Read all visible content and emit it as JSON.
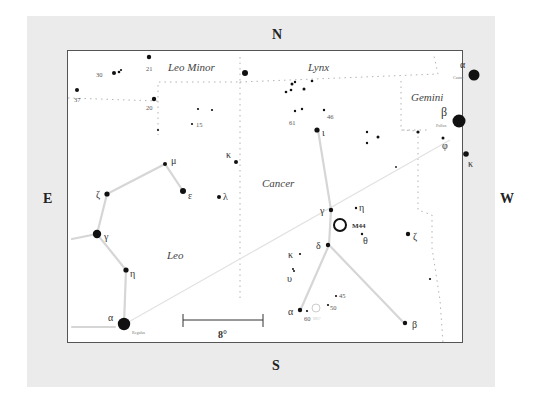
{
  "compass": {
    "north": "N",
    "south": "S",
    "east": "E",
    "west": "W"
  },
  "constellations": {
    "leo_minor": "Leo Minor",
    "lynx": "Lynx",
    "gemini": "Gemini",
    "cancer": "Cancer",
    "leo": "Leo"
  },
  "scale_bar": {
    "label": "8°"
  },
  "star_names": {
    "castor": "Castor",
    "pollux": "Pollux",
    "regulus": "Regulus"
  },
  "deep_sky": {
    "m44": "M44",
    "m67": "M67"
  },
  "labels": {
    "n30": "30",
    "n21": "21",
    "n37": "37",
    "n20": "20",
    "n15": "15",
    "n61": "61",
    "n46": "46",
    "n45": "45",
    "n50": "50",
    "n60": "60",
    "gem_alpha": "α",
    "gem_beta": "β",
    "gem_phi": "φ",
    "gem_kappa": "κ",
    "cnc_iota": "ι",
    "cnc_gamma": "γ",
    "cnc_eta": "η",
    "cnc_theta": "θ",
    "cnc_delta": "δ",
    "cnc_kappa": "κ",
    "cnc_upsilon": "υ",
    "cnc_alpha": "α",
    "cnc_beta": "β",
    "cnc_zeta": "ζ",
    "leo_mu": "μ",
    "leo_epsilon": "ε",
    "leo_zeta": "ζ",
    "leo_gamma": "γ",
    "leo_eta": "η",
    "leo_alpha": "α",
    "lmi_kappa": "κ",
    "lmi_lambda": "λ"
  }
}
